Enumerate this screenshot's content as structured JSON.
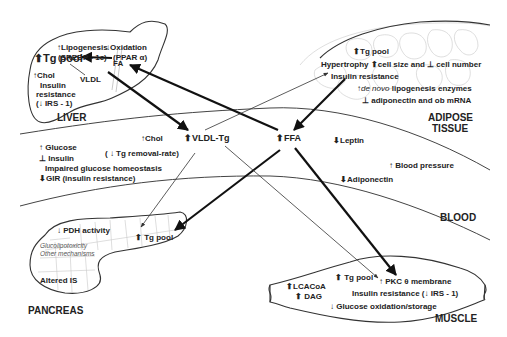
{
  "liver": {
    "label": "LIVER",
    "lipogenesis": "↑Lipogenesis",
    "srebp": "(SREBP - 1c)",
    "oxidation": "↓Oxidation",
    "ppar": "(PPAR α)",
    "tg_pool": "⬆Tg pool",
    "fa": "FA",
    "chol": "↑Chol",
    "vldl": "VLDL",
    "insulin": "Insulin",
    "resistance": "resistance",
    "irs": "(↓ IRS - 1)"
  },
  "adipose": {
    "label_line1": "ADIPOSE",
    "label_line2": "TISSUE",
    "tg_pool": "⬆Tg pool",
    "hypertrophy": "Hypertrophy ⬆cell size and ⊥ cell number",
    "insulin_resistance": "Insulin resistance",
    "de_novo_prefix": "↑",
    "de_novo_italic": "de novo",
    "de_novo_rest": " lipogenesis enzymes",
    "adiponectin_mrna": "⊥  adiponectin and ob mRNA"
  },
  "blood": {
    "label": "BLOOD",
    "chol": "↑Chol",
    "vldl_tg": "⬆VLDL-Tg",
    "tg_removal": "( ↓ Tg removal-rate)",
    "ffa": "⬆FFA",
    "leptin": "⬇Leptin",
    "blood_pressure": "↑ Blood pressure",
    "adiponectin": "⬇Adiponectin",
    "glucose": "↑  Glucose",
    "insulin": "⊥  Insulin",
    "impaired": "Impaired glucose homeostasis",
    "gir": "⬇GIR (insulin resistance)"
  },
  "pancreas": {
    "label": "PANCREAS",
    "pdh": "↓ PDH activity",
    "tg_pool": "⬆ Tg pool",
    "glucolipotoxicity": "Glucolipotoxicity",
    "other_mechanisms": "Other mechanisms",
    "altered_is": "Altered IS"
  },
  "muscle": {
    "label": "MUSCLE",
    "tg_pool": "⬆ Tg pool",
    "pkc": "↑ PKC θ membrane",
    "lcacoa": "⬆LCACoA",
    "dag": "⬆ DAG",
    "insulin_resistance": "Insulin resistance (↓ IRS - 1)",
    "glucose_ox": "↓ Glucose oxidation/storage"
  },
  "colors": {
    "line": "#111111",
    "thin_line": "#333333",
    "text": "#222222",
    "cell_outline": "#c8c8c8",
    "background": "#ffffff"
  }
}
